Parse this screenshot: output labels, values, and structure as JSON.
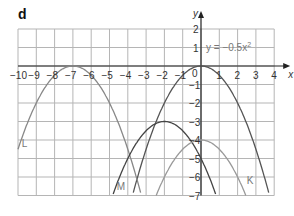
{
  "part_label": "d",
  "chart_data": {
    "type": "line",
    "title": "",
    "xlabel": "x",
    "ylabel": "y",
    "xlim": [
      -10,
      4
    ],
    "ylim": [
      -7,
      2
    ],
    "grid": true,
    "x_ticks": [
      "-10",
      "-9",
      "-8",
      "-7",
      "-6",
      "-5",
      "-4",
      "-3",
      "-2",
      "-1",
      "0",
      "1",
      "2",
      "3",
      "4"
    ],
    "y_ticks": [
      "2",
      "1",
      "-1",
      "-2",
      "-3",
      "-4",
      "-5",
      "-6",
      "-7"
    ],
    "origin_label": "0",
    "series": [
      {
        "name": "y = -0.5x²",
        "a": -0.5,
        "h": 0,
        "k": 0,
        "color": "#555555",
        "label": "y = −0.5x",
        "label_sup": "2"
      },
      {
        "name": "L",
        "a": -0.5,
        "h": -7,
        "k": 0,
        "color": "#888888",
        "label": "L"
      },
      {
        "name": "M",
        "a": -0.5,
        "h": -2,
        "k": -3,
        "color": "#444444",
        "label": "M"
      },
      {
        "name": "K",
        "a": -0.5,
        "h": 0,
        "k": -4,
        "color": "#999999",
        "label": "K"
      }
    ]
  }
}
